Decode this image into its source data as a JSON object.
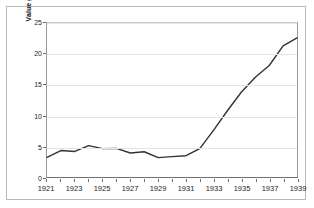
{
  "chart_data": {
    "type": "line",
    "title": "",
    "subtitle": "",
    "xlabel": "",
    "ylabel": "Value (Cdn $ millions)",
    "xlim": [
      1921,
      1939
    ],
    "ylim": [
      0,
      25
    ],
    "grid": true,
    "legend": false,
    "legend_position": "none",
    "y_ticks": [
      25,
      20,
      15,
      10,
      5,
      0
    ],
    "y_tick_labels": [
      "25",
      "20",
      "15",
      "10",
      "5",
      "0"
    ],
    "x_ticks": [
      1921,
      1922,
      1923,
      1924,
      1925,
      1926,
      1927,
      1928,
      1929,
      1930,
      1931,
      1932,
      1933,
      1934,
      1935,
      1936,
      1937,
      1938,
      1939
    ],
    "x_tick_labels_shown": [
      "1921",
      "1923",
      "1925",
      "1927",
      "1929",
      "1931",
      "1933",
      "1935",
      "1937",
      "1939"
    ],
    "line_color": "#333333",
    "grid_color": "#e4e4e4",
    "x": [
      1921,
      1922,
      1923,
      1924,
      1925,
      1926,
      1927,
      1928,
      1929,
      1930,
      1931,
      1932,
      1933,
      1934,
      1935,
      1936,
      1937,
      1938,
      1939
    ],
    "values": [
      3.2,
      4.3,
      4.15,
      5.1,
      4.6,
      4.65,
      3.9,
      4.1,
      3.15,
      3.3,
      3.45,
      4.6,
      7.6,
      10.8,
      13.8,
      16.2,
      18.1,
      21.3,
      22.6
    ],
    "series": [
      {
        "name": "Value",
        "values": [
          3.2,
          4.3,
          4.15,
          5.1,
          4.6,
          4.65,
          3.9,
          4.1,
          3.15,
          3.3,
          3.45,
          4.6,
          7.6,
          10.8,
          13.8,
          16.2,
          18.1,
          21.3,
          22.6
        ]
      }
    ]
  }
}
